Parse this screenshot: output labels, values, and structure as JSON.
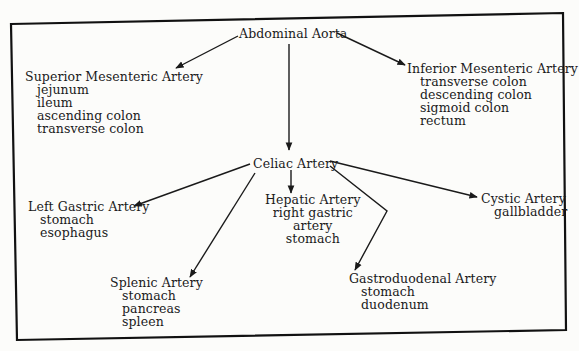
{
  "diagram": {
    "root": {
      "label": "Abdominal Aorta"
    },
    "superior_mesenteric": {
      "label": "Superior Mesenteric Artery",
      "supplies": [
        "jejunum",
        "ileum",
        "ascending colon",
        "transverse colon"
      ]
    },
    "inferior_mesenteric": {
      "label": "Inferior Mesenteric Artery",
      "supplies": [
        "transverse colon",
        "descending colon",
        "sigmoid colon",
        "rectum"
      ]
    },
    "celiac": {
      "label": "Celiac Artery"
    },
    "left_gastric": {
      "label": "Left Gastric Artery",
      "supplies": [
        "stomach",
        "esophagus"
      ]
    },
    "splenic": {
      "label": "Splenic Artery",
      "supplies": [
        "stomach",
        "pancreas",
        "spleen"
      ]
    },
    "hepatic": {
      "label": "Hepatic Artery",
      "supplies": [
        "right gastric",
        "artery",
        "stomach"
      ]
    },
    "gastroduodenal": {
      "label": "Gastroduodenal Artery",
      "supplies": [
        "stomach",
        "duodenum"
      ]
    },
    "cystic": {
      "label": "Cystic Artery",
      "supplies": [
        "gallbladder"
      ]
    },
    "edges": [
      [
        "Abdominal Aorta",
        "Superior Mesenteric Artery"
      ],
      [
        "Abdominal Aorta",
        "Inferior Mesenteric Artery"
      ],
      [
        "Abdominal Aorta",
        "Celiac Artery"
      ],
      [
        "Celiac Artery",
        "Left Gastric Artery"
      ],
      [
        "Celiac Artery",
        "Splenic Artery"
      ],
      [
        "Celiac Artery",
        "Hepatic Artery"
      ],
      [
        "Celiac Artery",
        "Gastroduodenal Artery"
      ],
      [
        "Celiac Artery",
        "Cystic Artery"
      ]
    ]
  }
}
